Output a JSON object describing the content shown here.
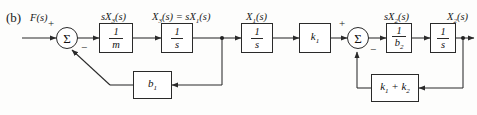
{
  "figure": {
    "panel_label": "(b)",
    "type": "block-diagram"
  },
  "signals": {
    "input": "F(s)",
    "after_first_integrator_input": "sX3(s)",
    "after_first_integrator": "X3(s) = sX1(s)",
    "after_second_integrator": "X1(s)",
    "before_last_integrator": "sX2(s)",
    "output": "X2(s)"
  },
  "signal_labels": [
    {
      "name": "input-signal",
      "text_main": "F",
      "text_arg": "(s)"
    },
    {
      "name": "sx3-signal",
      "text": "sX3(s)"
    },
    {
      "name": "x3-equals-sx1-signal",
      "text": "X3(s) = sX1(s)"
    },
    {
      "name": "x1-signal",
      "text": "X1(s)"
    },
    {
      "name": "sx2-signal",
      "text": "sX2(s)"
    },
    {
      "name": "x2-signal",
      "text": "X2(s)"
    }
  ],
  "blocks": [
    {
      "id": "gain-1-over-m",
      "kind": "fraction",
      "numerator": "1",
      "denominator": "m"
    },
    {
      "id": "integrator-1",
      "kind": "fraction",
      "numerator": "1",
      "denominator": "s"
    },
    {
      "id": "integrator-2",
      "kind": "fraction",
      "numerator": "1",
      "denominator": "s"
    },
    {
      "id": "gain-k1",
      "kind": "plain",
      "text": "k1"
    },
    {
      "id": "gain-1-over-b2",
      "kind": "fraction",
      "numerator": "1",
      "denominator": "b2"
    },
    {
      "id": "integrator-3",
      "kind": "fraction",
      "numerator": "1",
      "denominator": "s"
    },
    {
      "id": "feedback-b1",
      "kind": "plain",
      "text": "b1"
    },
    {
      "id": "feedback-k1-plus-k2",
      "kind": "plain",
      "text": "k1 + k2"
    }
  ],
  "summing_junctions": [
    {
      "id": "summing-junction-left",
      "symbol": "Σ",
      "signs": [
        {
          "label": "+",
          "position": "top-left"
        },
        {
          "label": "−",
          "position": "bottom-right"
        }
      ]
    },
    {
      "id": "summing-junction-right",
      "symbol": "Σ",
      "signs": [
        {
          "label": "+",
          "position": "top-left"
        },
        {
          "label": "−",
          "position": "bottom-right"
        }
      ]
    }
  ],
  "colors": {
    "line": "#2a2a2a",
    "text": "#1a1a1a",
    "background": "#fdfdfc"
  }
}
